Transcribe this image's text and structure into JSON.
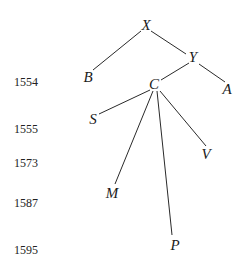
{
  "diagram": {
    "type": "stemma-tree",
    "nodes": {
      "X": {
        "label": "X",
        "x": 146,
        "y": 25
      },
      "Y": {
        "label": "Y",
        "x": 193,
        "y": 57
      },
      "B": {
        "label": "B",
        "x": 88,
        "y": 77
      },
      "A": {
        "label": "A",
        "x": 227,
        "y": 89
      },
      "C": {
        "label": "C",
        "x": 154,
        "y": 84
      },
      "S": {
        "label": "S",
        "x": 93,
        "y": 119
      },
      "V": {
        "label": "V",
        "x": 206,
        "y": 154
      },
      "M": {
        "label": "M",
        "x": 112,
        "y": 193
      },
      "P": {
        "label": "P",
        "x": 175,
        "y": 245
      }
    },
    "edges": [
      {
        "from": "X",
        "to": "B",
        "x1": 141,
        "y1": 31,
        "x2": 93,
        "y2": 70
      },
      {
        "from": "X",
        "to": "Y",
        "x1": 151,
        "y1": 31,
        "x2": 186,
        "y2": 54
      },
      {
        "from": "Y",
        "to": "C",
        "x1": 189,
        "y1": 63,
        "x2": 161,
        "y2": 80
      },
      {
        "from": "Y",
        "to": "A",
        "x1": 199,
        "y1": 64,
        "x2": 225,
        "y2": 82
      },
      {
        "from": "C",
        "to": "S",
        "x1": 150,
        "y1": 90,
        "x2": 99,
        "y2": 114
      },
      {
        "from": "C",
        "to": "M",
        "x1": 153,
        "y1": 91,
        "x2": 115,
        "y2": 184
      },
      {
        "from": "C",
        "to": "P",
        "x1": 157,
        "y1": 91,
        "x2": 172,
        "y2": 235
      },
      {
        "from": "C",
        "to": "V",
        "x1": 160,
        "y1": 91,
        "x2": 206,
        "y2": 146
      }
    ],
    "years": [
      {
        "label": "1554",
        "y": 82
      },
      {
        "label": "1555",
        "y": 129
      },
      {
        "label": "1573",
        "y": 163
      },
      {
        "label": "1587",
        "y": 203
      },
      {
        "label": "1595",
        "y": 250
      }
    ]
  }
}
